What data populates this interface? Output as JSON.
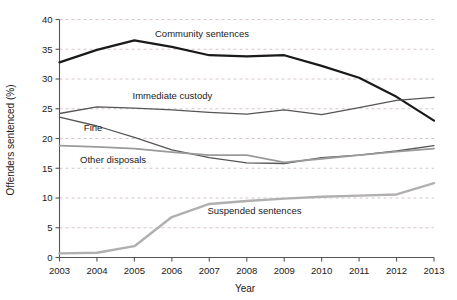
{
  "chart_data": {
    "type": "line",
    "title": "",
    "xlabel": "Year",
    "ylabel": "Offenders sentenced (%)",
    "categories": [
      2003,
      2004,
      2005,
      2006,
      2007,
      2008,
      2009,
      2010,
      2011,
      2012,
      2013
    ],
    "x": [
      "2003",
      "2004",
      "2005",
      "2006",
      "2007",
      "2008",
      "2009",
      "2010",
      "2011",
      "2012",
      "2013"
    ],
    "xlim": [
      2003,
      2013
    ],
    "ylim": [
      0,
      40
    ],
    "yticks": [
      "0",
      "5",
      "10",
      "15",
      "20",
      "25",
      "30",
      "35",
      "40"
    ],
    "ytick_values": [
      0,
      5,
      10,
      15,
      20,
      25,
      30,
      35,
      40
    ],
    "grid": true,
    "grid_style": "dashed-horizontal",
    "legend": "inline-annotations",
    "series": [
      {
        "name": "Community sentences",
        "color": "#1a1a1a",
        "width": 2.2,
        "label_x": 2005.55,
        "label_y": 37.6,
        "values": [
          32.8,
          34.9,
          36.5,
          35.4,
          34.0,
          33.8,
          34.0,
          32.2,
          30.2,
          27.0,
          23.0
        ]
      },
      {
        "name": "Immediate custody",
        "color": "#555555",
        "width": 1.3,
        "label_x": 2004.95,
        "label_y": 27.2,
        "values": [
          24.2,
          25.3,
          25.1,
          24.8,
          24.4,
          24.1,
          24.8,
          24.0,
          25.2,
          26.4,
          26.9
        ]
      },
      {
        "name": "Fine",
        "color": "#555555",
        "width": 1.3,
        "label_x": 2003.65,
        "label_y": 21.8,
        "values": [
          23.6,
          22.1,
          20.2,
          18.1,
          16.8,
          15.9,
          15.8,
          16.8,
          17.2,
          17.9,
          18.8
        ]
      },
      {
        "name": "Other disposals",
        "color": "#9a9a9a",
        "width": 1.8,
        "label_x": 2003.55,
        "label_y": 16.4,
        "values": [
          18.8,
          18.6,
          18.3,
          17.7,
          17.2,
          17.2,
          16.0,
          16.6,
          17.2,
          17.8,
          18.3
        ]
      },
      {
        "name": "Suspended sentences",
        "color": "#b0b0b0",
        "width": 2.4,
        "label_x": 2006.95,
        "label_y": 7.9,
        "values": [
          0.7,
          0.8,
          1.9,
          6.8,
          9.0,
          9.5,
          9.9,
          10.2,
          10.4,
          10.6,
          12.5
        ]
      }
    ]
  },
  "axes": {
    "x_title": "Year",
    "y_title": "Offenders sentenced (%)"
  }
}
